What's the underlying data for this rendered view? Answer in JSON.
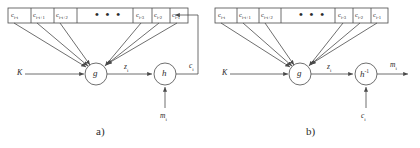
{
  "figure": {
    "kind": "diagram",
    "line_color": "#4a4a4a",
    "text_color": "#2b2b2b",
    "background": "#ffffff"
  },
  "panels": [
    {
      "id": "a",
      "caption": "a)",
      "register": {
        "name": "shift-register",
        "ellipsis": "• • •",
        "cells": [
          {
            "base": "c",
            "sub": "i-t"
          },
          {
            "base": "c",
            "sub": "i-t+1"
          },
          {
            "base": "c",
            "sub": "i-t+2"
          },
          {
            "base": "c",
            "sub": "i-3"
          },
          {
            "base": "c",
            "sub": "i-2"
          },
          {
            "base": "c",
            "sub": "i-1"
          }
        ]
      },
      "nodes": [
        {
          "name": "g",
          "label": "g",
          "sup": ""
        },
        {
          "name": "h",
          "label": "h",
          "sup": ""
        }
      ],
      "signals": {
        "key_input": "K",
        "g_output": {
          "base": "z",
          "sub": "i"
        },
        "h_lower_input": {
          "base": "m",
          "sub": "i"
        },
        "h_output_feedback": {
          "base": "c",
          "sub": "i"
        }
      }
    },
    {
      "id": "b",
      "caption": "b)",
      "register": {
        "name": "shift-register",
        "ellipsis": "• • •",
        "cells": [
          {
            "base": "c",
            "sub": "i-t"
          },
          {
            "base": "c",
            "sub": "i-t+1"
          },
          {
            "base": "c",
            "sub": "i-t+2"
          },
          {
            "base": "c",
            "sub": "i-3"
          },
          {
            "base": "c",
            "sub": "i-2"
          },
          {
            "base": "c",
            "sub": "i-1"
          }
        ]
      },
      "nodes": [
        {
          "name": "g",
          "label": "g",
          "sup": ""
        },
        {
          "name": "h-inverse",
          "label": "h",
          "sup": "-1"
        }
      ],
      "signals": {
        "key_input": "K",
        "g_output": {
          "base": "z",
          "sub": "i"
        },
        "h_lower_input": {
          "base": "c",
          "sub": "i"
        },
        "h_output": {
          "base": "m",
          "sub": "i"
        }
      }
    }
  ]
}
